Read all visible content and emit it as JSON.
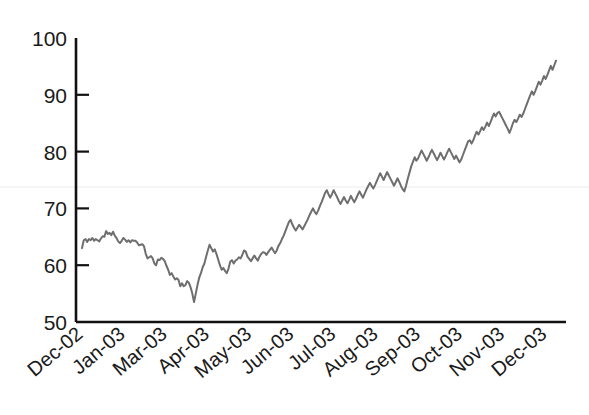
{
  "chart_data": {
    "type": "line",
    "title": "",
    "subtitle": "",
    "xlabel": "",
    "ylabel": "",
    "ylim": [
      50,
      100
    ],
    "ytick_values": [
      50,
      60,
      70,
      80,
      90,
      100
    ],
    "ytick_labels": [
      "50",
      "60",
      "70",
      "80",
      "90",
      "100"
    ],
    "xtick_labels": [
      "Dec-02",
      "Jan-03",
      "Mar-03",
      "Apr-03",
      "May-03",
      "Jun-03",
      "Jul-03",
      "Aug-03",
      "Sep-03",
      "Oct-03",
      "Nov-03",
      "Dec-03"
    ],
    "grid": false,
    "legend": "none",
    "line_color": "#6e6e6e",
    "axis_color": "#111111",
    "background": "#ffffff",
    "series": [
      {
        "name": "index",
        "values": [
          63.0,
          64.4,
          64.6,
          64.1,
          64.6,
          64.4,
          64.8,
          64.3,
          64.6,
          64.4,
          64.2,
          64.7,
          65.1,
          65.0,
          66.0,
          65.5,
          65.7,
          65.3,
          65.9,
          65.2,
          64.8,
          64.2,
          63.9,
          64.3,
          64.8,
          64.5,
          64.1,
          64.4,
          64.0,
          64.4,
          64.3,
          64.3,
          64.0,
          63.5,
          63.6,
          63.7,
          63.3,
          62.0,
          61.2,
          61.4,
          61.6,
          61.2,
          60.3,
          60.0,
          61.0,
          60.9,
          61.3,
          61.1,
          60.7,
          59.9,
          59.2,
          58.3,
          58.6,
          58.0,
          57.5,
          57.7,
          57.4,
          56.3,
          56.8,
          56.3,
          56.5,
          57.2,
          56.9,
          56.1,
          55.0,
          53.5,
          55.0,
          56.5,
          57.8,
          58.6,
          59.6,
          60.3,
          61.5,
          62.6,
          63.6,
          63.0,
          62.4,
          62.8,
          62.0,
          61.0,
          60.0,
          59.2,
          59.5,
          59.0,
          58.6,
          59.4,
          60.6,
          60.9,
          60.3,
          60.8,
          61.0,
          61.4,
          61.2,
          61.8,
          62.6,
          62.4,
          61.5,
          61.1,
          60.7,
          61.2,
          61.7,
          61.2,
          60.8,
          61.5,
          62.0,
          62.3,
          62.2,
          61.8,
          62.3,
          62.7,
          63.1,
          62.6,
          62.1,
          62.6,
          63.4,
          63.9,
          64.6,
          65.2,
          66.0,
          66.8,
          67.6,
          68.0,
          67.2,
          66.6,
          66.1,
          66.6,
          67.1,
          66.7,
          66.3,
          66.9,
          67.5,
          68.1,
          68.8,
          69.4,
          70.0,
          69.4,
          69.0,
          69.6,
          70.4,
          71.1,
          71.9,
          72.7,
          73.2,
          72.5,
          71.9,
          72.5,
          73.2,
          72.6,
          72.0,
          71.3,
          70.8,
          71.4,
          72.0,
          71.4,
          70.9,
          71.5,
          72.2,
          71.6,
          71.1,
          71.7,
          72.4,
          73.0,
          72.4,
          71.9,
          72.6,
          73.3,
          73.9,
          74.5,
          74.0,
          73.5,
          74.1,
          74.8,
          75.5,
          76.2,
          75.6,
          75.0,
          75.7,
          76.4,
          75.8,
          75.2,
          74.6,
          74.0,
          74.6,
          75.3,
          74.7,
          74.0,
          73.4,
          73.0,
          74.0,
          75.2,
          76.3,
          77.4,
          78.2,
          79.0,
          78.4,
          78.8,
          79.5,
          80.2,
          79.6,
          79.0,
          78.4,
          79.0,
          79.7,
          80.3,
          79.7,
          79.1,
          78.5,
          79.1,
          79.8,
          79.2,
          78.6,
          79.2,
          79.9,
          80.5,
          79.9,
          79.3,
          78.7,
          79.3,
          78.7,
          78.1,
          78.6,
          79.4,
          80.2,
          81.0,
          81.8,
          82.0,
          81.4,
          82.0,
          82.8,
          83.5,
          83.0,
          83.6,
          84.3,
          83.8,
          84.4,
          85.1,
          84.5,
          85.2,
          86.0,
          86.7,
          86.2,
          86.8,
          87.0,
          86.4,
          85.8,
          85.2,
          84.6,
          84.0,
          83.3,
          84.1,
          85.0,
          85.6,
          85.2,
          85.8,
          86.5,
          86.1,
          86.7,
          87.5,
          88.3,
          89.1,
          89.9,
          90.6,
          90.0,
          90.7,
          91.5,
          92.3,
          91.8,
          92.5,
          93.3,
          92.8,
          93.5,
          94.3,
          95.1,
          94.4,
          95.2,
          96.0
        ]
      }
    ],
    "annotations": {
      "start_value": 63.0,
      "end_value": 96.0,
      "min_value": 53.5,
      "max_value": 96.0
    }
  }
}
